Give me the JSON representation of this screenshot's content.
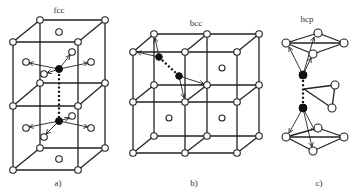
{
  "panels": [
    {
      "id": "a",
      "structure_label": "fcc",
      "caption": "a)"
    },
    {
      "id": "b",
      "structure_label": "bcc",
      "caption": "b)"
    },
    {
      "id": "c",
      "structure_label": "hcp",
      "caption": "c)"
    }
  ],
  "legend": {
    "host_atom": "open circle",
    "solute_atom": "filled circle",
    "pair_bond": "dotted line",
    "neighbor_relation": "arrow"
  },
  "colors": {
    "line": "#222222",
    "solute": "#111111",
    "background": "#ffffff"
  }
}
